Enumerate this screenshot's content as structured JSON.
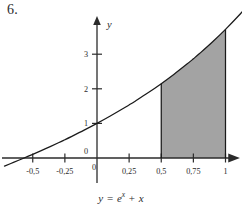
{
  "figure": {
    "problem_number": "6.",
    "caption_parts": {
      "lhs": "y",
      "equals": "=",
      "base": "e",
      "exponent": "x",
      "plus": "+",
      "term": "x"
    },
    "caption_text": "y = e^x + x"
  },
  "chart_data": {
    "type": "line",
    "title": "",
    "subtitle": "",
    "function": "y = e^x + x",
    "xlabel": "",
    "ylabel": "y",
    "xlim": [
      -0.72,
      1.18
    ],
    "ylim": [
      -0.35,
      3.9
    ],
    "grid": false,
    "legend": false,
    "x_tick_labels": [
      "-0,5",
      "-0,25",
      "0",
      "0,25",
      "0,5",
      "0,75",
      "1"
    ],
    "x_tick_values": [
      -0.5,
      -0.25,
      0,
      0.25,
      0.5,
      0.75,
      1
    ],
    "y_tick_labels": [
      "0",
      "1",
      "2",
      "3"
    ],
    "y_tick_values": [
      0,
      1,
      2,
      3
    ],
    "origin_label": "0",
    "axis_y_name": "y",
    "x_root": -0.5671,
    "curve_points": [
      {
        "x": -0.72,
        "y": -0.2334
      },
      {
        "x": -0.65,
        "y": -0.1278
      },
      {
        "x": -0.5671,
        "y": 0.0
      },
      {
        "x": -0.5,
        "y": 0.1065
      },
      {
        "x": -0.4,
        "y": 0.2703
      },
      {
        "x": -0.3,
        "y": 0.4408
      },
      {
        "x": -0.25,
        "y": 0.5288
      },
      {
        "x": -0.2,
        "y": 0.6187
      },
      {
        "x": -0.1,
        "y": 0.8048
      },
      {
        "x": 0.0,
        "y": 1.0
      },
      {
        "x": 0.1,
        "y": 1.2052
      },
      {
        "x": 0.2,
        "y": 1.4214
      },
      {
        "x": 0.25,
        "y": 1.534
      },
      {
        "x": 0.3,
        "y": 1.6499
      },
      {
        "x": 0.4,
        "y": 1.8918
      },
      {
        "x": 0.5,
        "y": 2.1487
      },
      {
        "x": 0.6,
        "y": 2.4221
      },
      {
        "x": 0.7,
        "y": 2.7138
      },
      {
        "x": 0.75,
        "y": 2.867
      },
      {
        "x": 0.8,
        "y": 3.0255
      },
      {
        "x": 0.9,
        "y": 3.3596
      },
      {
        "x": 1.0,
        "y": 3.7183
      },
      {
        "x": 1.1,
        "y": 4.1042
      },
      {
        "x": 1.18,
        "y": 4.4343
      }
    ],
    "shaded_region": {
      "label": "",
      "x_from": 0.5,
      "x_to": 1.0,
      "y_from": 0,
      "fill_color": "#a3a3a3",
      "description": "area under y = e^x + x between x = 0,5 and x = 1"
    },
    "colors": {
      "curve": "#1a1a1a",
      "axis": "#2b2b2b",
      "shade": "#a3a3a3",
      "background": "#ffffff"
    }
  }
}
